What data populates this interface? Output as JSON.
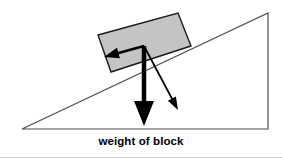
{
  "figure": {
    "name": "block-on-incline-free-body-diagram",
    "width": 282,
    "height": 160,
    "background_color": "#ffffff",
    "caption": "weight of block"
  },
  "colors": {
    "incline_stroke": "#4d4d4d",
    "block_fill": "#c4c4c4",
    "block_stroke": "#1a1a1a",
    "arrow_color": "#000000",
    "caption_color": "#000000",
    "baseline_stroke": "#d0d0d0"
  },
  "incline": {
    "label": "inclined-plane-triangle",
    "apex": {
      "x": 268,
      "y": 13
    },
    "bottom_left": {
      "x": 22,
      "y": 129
    },
    "bottom_right": {
      "x": 268,
      "y": 129
    },
    "stroke_width": 1.2
  },
  "block": {
    "label": "block",
    "fill": "#c4c4c4",
    "stroke_width": 1.4,
    "corners": [
      {
        "x": 98,
        "y": 35
      },
      {
        "x": 178,
        "y": 13
      },
      {
        "x": 191,
        "y": 46
      },
      {
        "x": 111,
        "y": 72
      }
    ]
  },
  "vectors": {
    "origin": {
      "x": 144,
      "y": 46
    },
    "items": [
      {
        "id": "normal-component-arrow",
        "name": "component-parallel-arrow",
        "description": "thick arrow pointing left and slightly up, along the incline surface",
        "from": {
          "x": 144,
          "y": 46
        },
        "to": {
          "x": 104,
          "y": 57
        },
        "shaft_width": 2.6,
        "head_length": 15,
        "head_width": 11,
        "label": ""
      },
      {
        "id": "weight-arrow",
        "name": "weight-vector-arrow",
        "description": "thick vertical arrow pointing straight down, labelled weight of block",
        "from": {
          "x": 144,
          "y": 46
        },
        "to": {
          "x": 144,
          "y": 126
        },
        "shaft_width": 4.5,
        "head_length": 25,
        "head_width": 20,
        "label": "weight of block"
      },
      {
        "id": "perpendicular-component-arrow",
        "name": "component-perpendicular-arrow",
        "description": "thin arrow pointing down and to the right, perpendicular into the incline",
        "from": {
          "x": 144,
          "y": 46
        },
        "to": {
          "x": 178,
          "y": 110
        },
        "shaft_width": 1.8,
        "head_length": 13,
        "head_width": 9,
        "label": ""
      }
    ]
  },
  "baseline": {
    "label": "bottom-rule",
    "y": 157,
    "x1": 0,
    "x2": 282
  }
}
